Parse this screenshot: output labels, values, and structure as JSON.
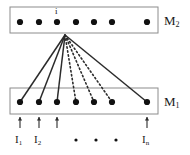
{
  "figure": {
    "type": "diagram",
    "background_color": "#ffffff",
    "line_color": "#2b2b2b",
    "box_border_color": "#8c8c8c",
    "dot_color": "#111111"
  },
  "top_layer": {
    "label": "M",
    "label_sub": "2",
    "label_x": 164,
    "label_y": 14,
    "box": {
      "x": 10,
      "y": 7,
      "width": 148,
      "height": 26
    },
    "node_label": "i",
    "node_label_x": 55,
    "node_label_y": 7,
    "dots": [
      {
        "cx": 20,
        "cy": 22
      },
      {
        "cx": 39,
        "cy": 22
      },
      {
        "cx": 57,
        "cy": 22
      },
      {
        "cx": 76,
        "cy": 22
      },
      {
        "cx": 94,
        "cy": 22
      },
      {
        "cx": 112,
        "cy": 22
      },
      {
        "cx": 147,
        "cy": 22
      }
    ]
  },
  "bottom_layer": {
    "label": "M",
    "label_sub": "1",
    "label_x": 164,
    "label_y": 95,
    "box": {
      "x": 10,
      "y": 88,
      "width": 148,
      "height": 26
    },
    "dots": [
      {
        "cx": 20,
        "cy": 102
      },
      {
        "cx": 39,
        "cy": 102
      },
      {
        "cx": 57,
        "cy": 102
      },
      {
        "cx": 76,
        "cy": 102
      },
      {
        "cx": 94,
        "cy": 102
      },
      {
        "cx": 112,
        "cy": 102
      },
      {
        "cx": 147,
        "cy": 102
      }
    ]
  },
  "fan": {
    "apex_x": 65,
    "apex_y": 35,
    "connections": [
      {
        "to_x": 20,
        "to_y": 102,
        "style": "solid"
      },
      {
        "to_x": 39,
        "to_y": 102,
        "style": "solid"
      },
      {
        "to_x": 57,
        "to_y": 102,
        "style": "solid"
      },
      {
        "to_x": 76,
        "to_y": 102,
        "style": "dotted"
      },
      {
        "to_x": 94,
        "to_y": 102,
        "style": "dotted"
      },
      {
        "to_x": 112,
        "to_y": 102,
        "style": "dotted"
      },
      {
        "to_x": 147,
        "to_y": 102,
        "style": "solid"
      }
    ]
  },
  "inputs": {
    "arrows": [
      {
        "x": 20,
        "y_from": 128,
        "y_to": 117
      },
      {
        "x": 39,
        "y_from": 128,
        "y_to": 117
      },
      {
        "x": 57,
        "y_from": 128,
        "y_to": 117
      },
      {
        "x": 147,
        "y_from": 128,
        "y_to": 117
      }
    ],
    "labels": [
      {
        "text": "I",
        "sub": "1",
        "x": 15,
        "y": 134
      },
      {
        "text": "I",
        "sub": "2",
        "x": 34,
        "y": 134
      },
      {
        "text": "I",
        "sub": "n",
        "x": 142,
        "y": 134
      }
    ],
    "ellipsis_dots": [
      {
        "cx": 76,
        "cy": 140
      },
      {
        "cx": 96,
        "cy": 140
      },
      {
        "cx": 116,
        "cy": 140
      }
    ]
  }
}
